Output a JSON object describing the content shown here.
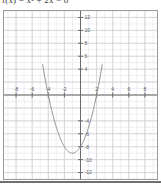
{
  "header": {
    "clipped_title": "f(x) = x² + 2x − 8"
  },
  "chart_data": {
    "type": "line",
    "title": "",
    "subtitle": "",
    "xlabel": "",
    "ylabel": "",
    "grid": true,
    "legend": false,
    "legend_position": "none",
    "xlim": [
      -9.5,
      9.5
    ],
    "ylim": [
      -13,
      13
    ],
    "xticks": [
      -8,
      -6,
      -4,
      -2,
      2,
      4,
      6,
      8
    ],
    "xtick_labels": [
      "-8",
      "-6",
      "-4",
      "-2",
      "2",
      "4",
      "6",
      "8"
    ],
    "yticks": [
      12,
      10,
      8,
      6,
      4,
      -4,
      -6,
      -8,
      -10,
      -12
    ],
    "ytick_labels": [
      "12",
      "10",
      "8",
      "6",
      "4",
      "-4",
      "-6",
      "-8",
      "-10",
      "-12"
    ],
    "minor_grid_step": 1,
    "major_grid_step": 2,
    "series": [
      {
        "name": "parabola",
        "color": "#8c8c8c",
        "equation": "y = x^2 + 2x - 8",
        "vertex": [
          -1,
          -9
        ],
        "roots": [
          -4,
          2
        ],
        "y_intercept": -8,
        "x": [
          -4.7,
          -4.5,
          -4.0,
          -3.5,
          -3.0,
          -2.5,
          -2.0,
          -1.5,
          -1.0,
          -0.5,
          0.0,
          0.5,
          1.0,
          1.5,
          2.0,
          2.5,
          2.7
        ],
        "values": [
          6.69,
          5.25,
          0.0,
          -2.75,
          -5.0,
          -6.75,
          -8.0,
          -8.75,
          -9.0,
          -8.75,
          -8.0,
          -6.75,
          -5.0,
          -2.75,
          0.0,
          3.25,
          4.69
        ]
      }
    ],
    "colors": {
      "axis": "#6b6b6b",
      "curve": "#8c8c8c",
      "major_grid": "#cfcfd6",
      "minor_grid": "#e6e6ec",
      "frame": "#9a9a9a",
      "tick_label": "#5a5a5a"
    }
  }
}
